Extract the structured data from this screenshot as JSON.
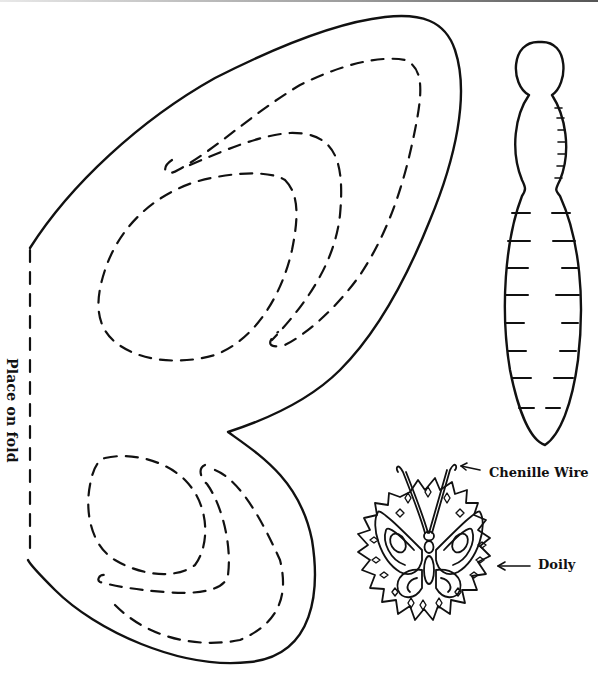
{
  "labels": {
    "fold": "Place on fold",
    "chenille_wire": "Chenille Wire",
    "doily": "Doily"
  },
  "pieces": [
    {
      "name": "wing-template",
      "cut_line": "solid",
      "fold_line": "dashed",
      "decor_lines": "dashed"
    },
    {
      "name": "body-template",
      "segments": 9
    },
    {
      "name": "finished-butterfly-illustration"
    }
  ],
  "colors": {
    "ink": "#111111",
    "paper": "#ffffff"
  }
}
